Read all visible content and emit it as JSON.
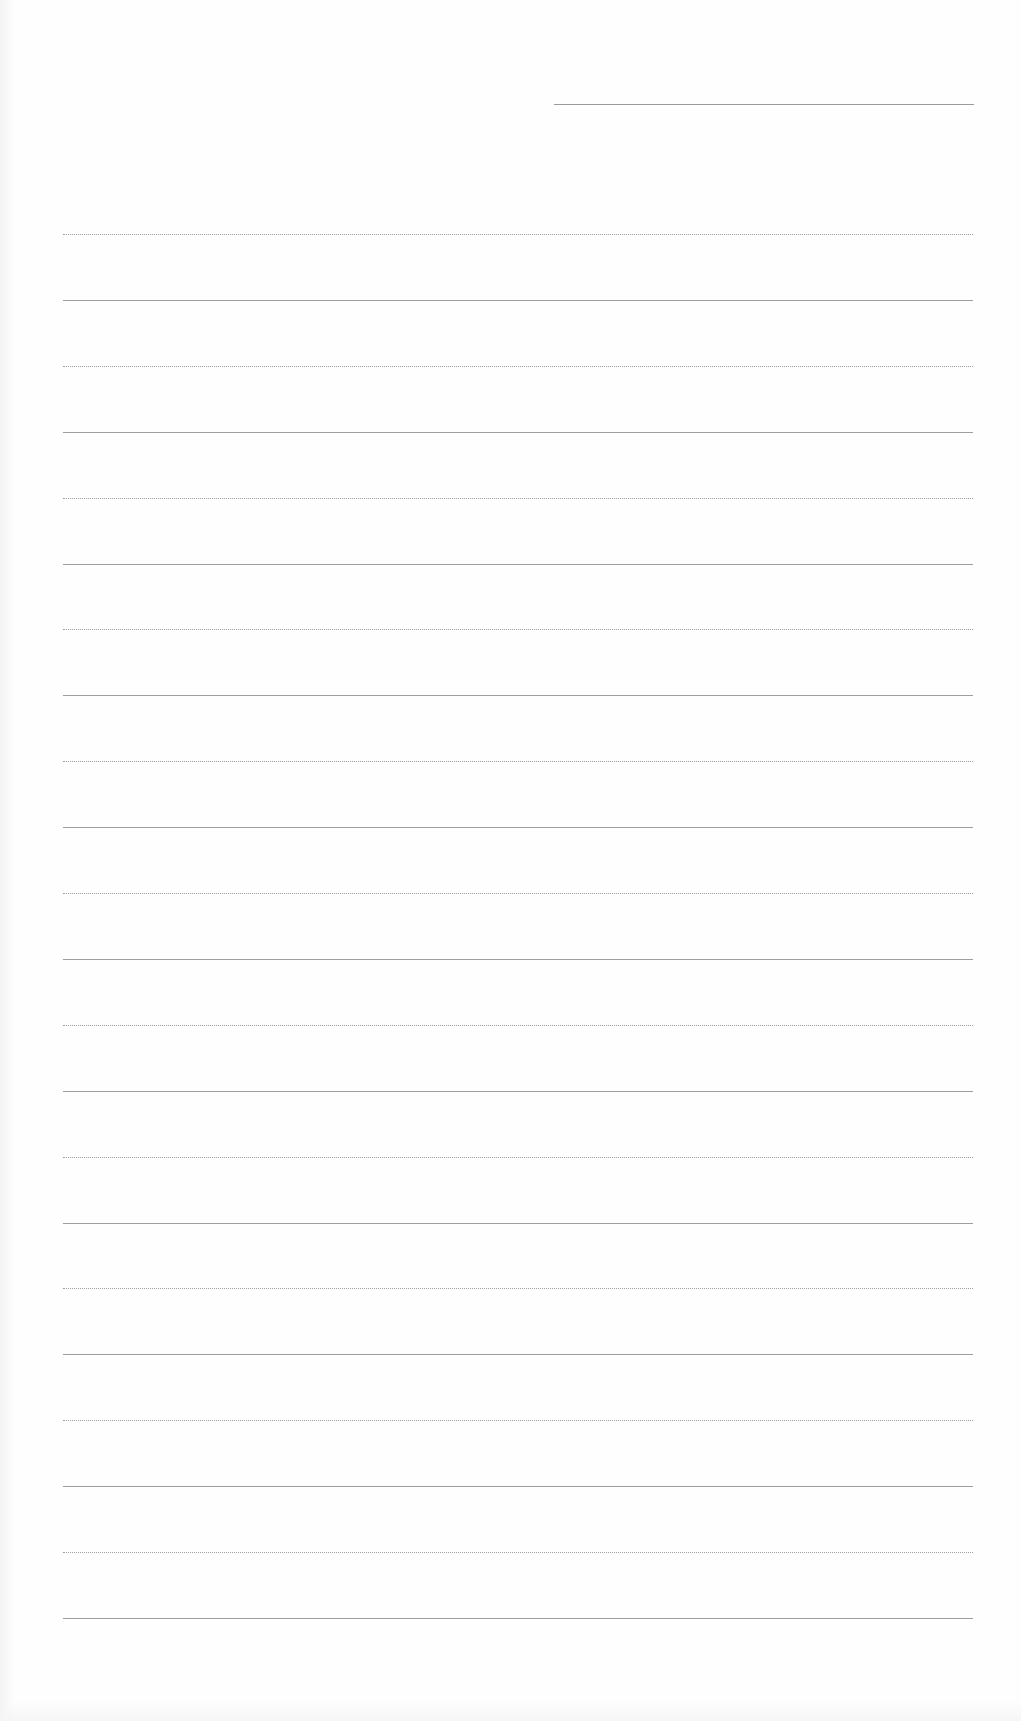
{
  "document": {
    "type": "blank ruled page",
    "header_line": {
      "x": 554,
      "y": 104,
      "width": 420
    },
    "ruled_lines": {
      "count": 22,
      "x": 63,
      "width": 910,
      "first_y": 234,
      "spacing": 65.9
    },
    "colors": {
      "paper": "#fefefe",
      "line": "#9e9e9e"
    },
    "text": []
  }
}
